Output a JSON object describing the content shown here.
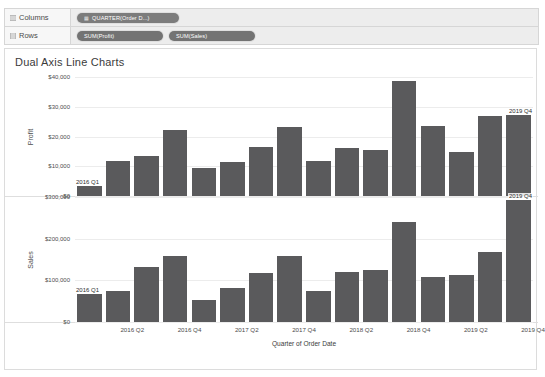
{
  "shelves": {
    "columns": {
      "label": "Columns",
      "icon": "grid-icon",
      "pills": [
        {
          "text": "QUARTER(Order D...)",
          "icon": "calendar-icon"
        }
      ]
    },
    "rows": {
      "label": "Rows",
      "icon": "grid-icon",
      "pills": [
        {
          "text": "SUM(Profit)",
          "icon": ""
        },
        {
          "text": "SUM(Sales)",
          "icon": ""
        }
      ]
    }
  },
  "view": {
    "title": "Dual Axis Line Charts"
  },
  "colors": {
    "bar": "#5a5a5c",
    "grid": "#ececec",
    "pill": "#7b7b7b",
    "panel_border": "#dcdcdc"
  },
  "chart_data": [
    {
      "type": "bar",
      "title": "Profit",
      "ylabel": "Profit",
      "xlabel": "Quarter of Order Date",
      "ylim": [
        0,
        40000
      ],
      "yticks": [
        0,
        10000,
        20000,
        30000,
        40000
      ],
      "ytick_labels": [
        "$0",
        "$10,000",
        "$20,000",
        "$30,000",
        "$40,000"
      ],
      "grid": true,
      "legend": "none",
      "categories": [
        "2016 Q1",
        "2016 Q2",
        "2016 Q3",
        "2016 Q4",
        "2017 Q1",
        "2017 Q2",
        "2017 Q3",
        "2017 Q4",
        "2018 Q1",
        "2018 Q2",
        "2018 Q3",
        "2018 Q4",
        "2019 Q1",
        "2019 Q2",
        "2019 Q3",
        "2019 Q4"
      ],
      "values": [
        3400,
        11800,
        13400,
        22100,
        9300,
        11600,
        16600,
        23200,
        11800,
        16000,
        15400,
        38700,
        23400,
        14700,
        26900,
        27400
      ],
      "annotations": [
        {
          "category": "2016 Q1",
          "text": "2016 Q1"
        },
        {
          "category": "2019 Q4",
          "text": "2019 Q4"
        }
      ]
    },
    {
      "type": "bar",
      "title": "Sales",
      "ylabel": "Sales",
      "xlabel": "Quarter of Order Date",
      "ylim": [
        0,
        300000
      ],
      "yticks": [
        0,
        100000,
        200000,
        300000
      ],
      "ytick_labels": [
        "$0",
        "$100,000",
        "$200,000",
        "$300,000"
      ],
      "grid": true,
      "legend": "none",
      "categories": [
        "2016 Q1",
        "2016 Q2",
        "2016 Q3",
        "2016 Q4",
        "2017 Q1",
        "2017 Q2",
        "2017 Q3",
        "2017 Q4",
        "2018 Q1",
        "2018 Q2",
        "2018 Q3",
        "2018 Q4",
        "2019 Q1",
        "2019 Q2",
        "2019 Q3",
        "2019 Q4"
      ],
      "values": [
        68000,
        75000,
        133000,
        158000,
        54000,
        81000,
        117000,
        158000,
        74000,
        119000,
        124000,
        240000,
        107000,
        114000,
        168000,
        292000
      ],
      "annotations": [
        {
          "category": "2016 Q1",
          "text": "2016 Q1"
        },
        {
          "category": "2019 Q4",
          "text": "2019 Q4"
        }
      ]
    }
  ],
  "xaxis": {
    "title": "Quarter of Order Date",
    "tick_labels": [
      "2016 Q2",
      "2016 Q4",
      "2017 Q2",
      "2017 Q4",
      "2018 Q2",
      "2018 Q4",
      "2019 Q2",
      "2019 Q4"
    ]
  }
}
